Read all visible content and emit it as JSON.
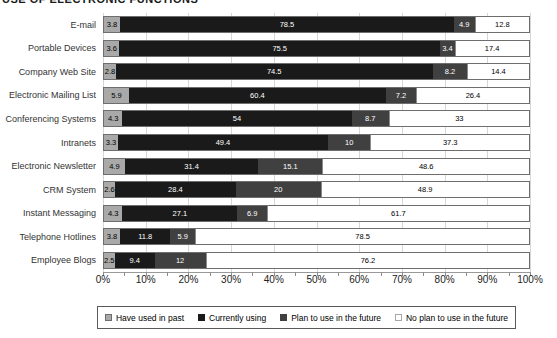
{
  "title": "USE OF ELECTRONIC FUNCTIONS",
  "chart_data": {
    "type": "bar",
    "orientation": "horizontal",
    "stacked": true,
    "grid": true,
    "legend_position": "bottom",
    "xlim": [
      0,
      100
    ],
    "x_ticks": [
      "0%",
      "10%",
      "20%",
      "30%",
      "40%",
      "50%",
      "60%",
      "70%",
      "80%",
      "90%",
      "100%"
    ],
    "categories": [
      "E-mail",
      "Portable Devices",
      "Company Web Site",
      "Electronic Mailing List",
      "Conferencing Systems",
      "Intranets",
      "Electronic Newsletter",
      "CRM System",
      "Instant Messaging",
      "Telephone Hotlines",
      "Employee Blogs"
    ],
    "series": [
      {
        "name": "Have used in past",
        "color": "#a9a9a9",
        "text_color": "#000000",
        "swatch_border": "#6e6e6e",
        "values": [
          3.8,
          3.6,
          2.8,
          5.9,
          4.3,
          3.3,
          4.9,
          2.6,
          4.3,
          3.8,
          2.5
        ]
      },
      {
        "name": "Currently using",
        "color": "#1a1a1a",
        "text_color": "#ffffff",
        "swatch_border": "#1a1a1a",
        "values": [
          78.5,
          75.5,
          74.5,
          60.4,
          54,
          49.4,
          31.4,
          28.4,
          27.1,
          11.8,
          9.4
        ]
      },
      {
        "name": "Plan to use in the future",
        "color": "#404040",
        "text_color": "#ffffff",
        "swatch_border": "#404040",
        "values": [
          4.9,
          3.4,
          8.2,
          7.2,
          8.7,
          10,
          15.1,
          20,
          6.9,
          5.9,
          12
        ]
      },
      {
        "name": "No plan to use in the future",
        "color": "#ffffff",
        "text_color": "#000000",
        "swatch_border": "#a8a8a8",
        "values": [
          12.8,
          17.4,
          14.4,
          26.4,
          33,
          37.3,
          48.6,
          48.9,
          61.7,
          78.5,
          76.2
        ]
      }
    ]
  }
}
